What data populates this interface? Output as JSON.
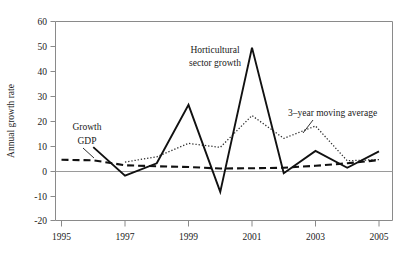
{
  "chart_data": {
    "type": "line",
    "title": "",
    "xlabel": "",
    "ylabel": "Annual growth rate",
    "xlim": [
      1995,
      2005
    ],
    "ylim": [
      -20,
      60
    ],
    "grid": false,
    "legend_position": "inline-annotations",
    "x_ticks": [
      "1995",
      "1997",
      "1999",
      "2001",
      "2003",
      "2005"
    ],
    "x_tick_values": [
      1995,
      1997,
      1999,
      2001,
      2003,
      2005
    ],
    "y_ticks": [
      "60",
      "50",
      "40",
      "30",
      "20",
      "10",
      "0",
      "-10",
      "-20"
    ],
    "y_tick_values": [
      60,
      50,
      40,
      30,
      20,
      10,
      0,
      -10,
      -20
    ],
    "x": [
      1995,
      1996,
      1997,
      1998,
      1999,
      2000,
      2001,
      2002,
      2003,
      2004,
      2005
    ],
    "series": [
      {
        "name": "Horticultural sector growth",
        "style": "solid",
        "color": "#111111",
        "x": [
          1996,
          1997,
          1998,
          1999,
          2000,
          2001,
          2002,
          2003,
          2004,
          2005
        ],
        "values": [
          9.5,
          -2.0,
          3.0,
          26.5,
          -8.5,
          49.5,
          -1.0,
          8.0,
          1.2,
          7.8
        ]
      },
      {
        "name": "Growth GDP",
        "style": "dashed",
        "color": "#111111",
        "x": [
          1995,
          1996,
          1997,
          1998,
          1999,
          2000,
          2001,
          2002,
          2003,
          2004,
          2005
        ],
        "values": [
          4.4,
          4.2,
          2.2,
          1.8,
          1.5,
          0.9,
          1.0,
          1.2,
          2.0,
          3.0,
          4.3
        ]
      },
      {
        "name": "3-year moving average",
        "style": "dotted",
        "color": "#2b2b2b",
        "x": [
          1997,
          1998,
          1999,
          2000,
          2001,
          2002,
          2003,
          2004,
          2005
        ],
        "values": [
          3.5,
          5.6,
          11.0,
          9.4,
          22.2,
          13.0,
          18.0,
          4.0,
          4.5
        ]
      }
    ],
    "annotations": [
      {
        "name": "horticultural-sector-growth",
        "line1": "Horticultural",
        "line2": "sector growth",
        "text": "Horticultural sector growth"
      },
      {
        "name": "growth-gdp",
        "line1": "Growth",
        "line2": "GDP",
        "text": "Growth GDP"
      },
      {
        "name": "three-year-moving-average",
        "line1": "3–year moving average",
        "text": "3–year moving average"
      }
    ]
  }
}
